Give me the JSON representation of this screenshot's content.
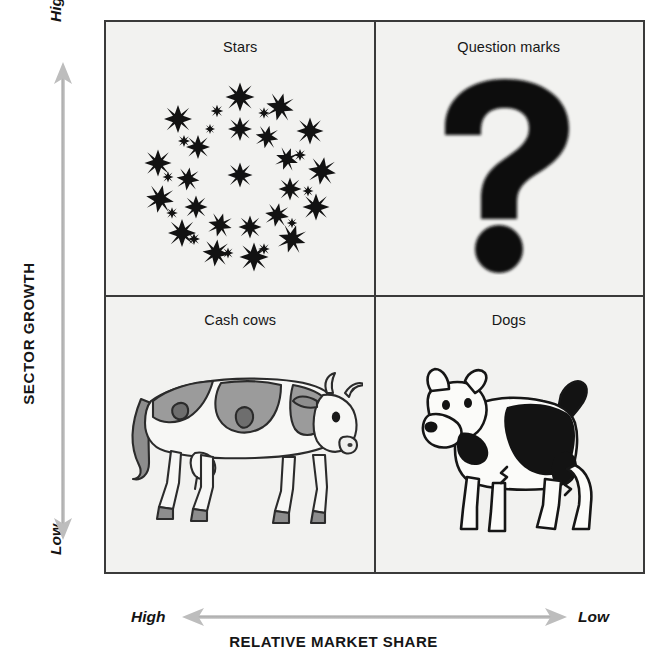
{
  "diagram": {
    "type": "bcg-growth-share-matrix",
    "background_color": "#ffffff",
    "panel_color": "#f2f2f0",
    "line_color": "#3a3a3a",
    "accent_gray": "#b5b5b5"
  },
  "y_axis": {
    "title": "SECTOR GROWTH",
    "high_label": "High",
    "low_label": "Low",
    "arrow": "double-headed-vertical-arrow"
  },
  "x_axis": {
    "title": "RELATIVE MARKET SHARE",
    "left_label": "High",
    "right_label": "Low",
    "arrow": "double-headed-horizontal-arrow"
  },
  "quadrants": [
    {
      "id": "stars",
      "label": "Stars",
      "position": "top-left",
      "growth": "High",
      "market_share": "High",
      "icon": "stars-ring-icon"
    },
    {
      "id": "question-marks",
      "label": "Question marks",
      "position": "top-right",
      "growth": "High",
      "market_share": "Low",
      "icon": "question-mark-icon"
    },
    {
      "id": "cash-cows",
      "label": "Cash cows",
      "position": "bottom-left",
      "growth": "Low",
      "market_share": "High",
      "icon": "cow-icon"
    },
    {
      "id": "dogs",
      "label": "Dogs",
      "position": "bottom-right",
      "growth": "Low",
      "market_share": "Low",
      "icon": "dog-icon"
    }
  ]
}
